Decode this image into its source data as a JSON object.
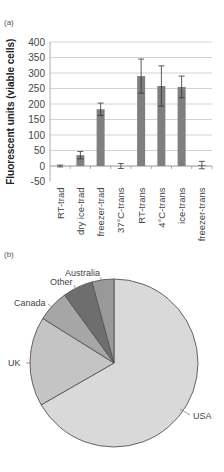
{
  "panels": {
    "a_label": "(a)",
    "b_label": "(b)"
  },
  "chart_data": [
    {
      "type": "bar",
      "title": "",
      "xlabel": "",
      "ylabel": "Fluorescent units (viable cells)",
      "ylim": [
        -50,
        400
      ],
      "yticks": [
        -50,
        0,
        50,
        100,
        150,
        200,
        250,
        300,
        350,
        400
      ],
      "grid": true,
      "categories": [
        "RT-trad",
        "dry ice-trad",
        "freezer-trad",
        "37°C-trans",
        "RT-trans",
        "4°C-trans",
        "ice-trans",
        "freezer-trans"
      ],
      "values": [
        0,
        35,
        183,
        0,
        290,
        258,
        255,
        3
      ],
      "errors": [
        3,
        12,
        20,
        8,
        55,
        65,
        35,
        12
      ],
      "bar_color": "#7f7f7f"
    },
    {
      "type": "pie",
      "title": "",
      "categories": [
        "USA",
        "UK",
        "Canada",
        "Other",
        "Australia"
      ],
      "values": [
        66.7,
        17.2,
        6.1,
        5.8,
        4.2
      ],
      "colors": [
        "#d9d9d9",
        "#c4c4c4",
        "#a6a6a6",
        "#6e6e6e",
        "#999999"
      ],
      "start_angle": "12 o'clock, clockwise"
    }
  ]
}
